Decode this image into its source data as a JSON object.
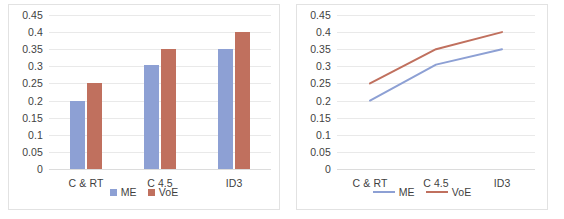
{
  "figure": {
    "panels": [
      {
        "id": "bar-panel",
        "name": "bar-chart-panel"
      },
      {
        "id": "line-panel",
        "name": "line-chart-panel"
      }
    ]
  },
  "colors": {
    "series_me": "#8DA0D4",
    "series_voe": "#C0705E",
    "gridline": "#E9E9E9",
    "axis_text": "#3F3F3F",
    "panel_border": "#E2E2E2",
    "background": "#FFFFFF"
  },
  "chart_data": [
    {
      "type": "bar",
      "title": "",
      "xlabel": "",
      "ylabel": "",
      "categories": [
        "C & RT",
        "C 4.5",
        "ID3"
      ],
      "series": [
        {
          "name": "ME",
          "values": [
            0.2,
            0.305,
            0.35
          ]
        },
        {
          "name": "VoE",
          "values": [
            0.25,
            0.35,
            0.4
          ]
        }
      ],
      "yticks": [
        0,
        0.05,
        0.1,
        0.15,
        0.2,
        0.25,
        0.3,
        0.35,
        0.4,
        0.45
      ],
      "ytick_labels": [
        "0",
        "0.05",
        "0.1",
        "0.15",
        "0.2",
        "0.25",
        "0.3",
        "0.35",
        "0.4",
        "0.45"
      ],
      "ylim": [
        0,
        0.45
      ],
      "grid": true,
      "legend": [
        "ME",
        "VoE"
      ],
      "legend_position": "bottom",
      "legend_marker": "square"
    },
    {
      "type": "line",
      "title": "",
      "xlabel": "",
      "ylabel": "",
      "categories": [
        "C & RT",
        "C 4.5",
        "ID3"
      ],
      "series": [
        {
          "name": "ME",
          "values": [
            0.2,
            0.305,
            0.35
          ]
        },
        {
          "name": "VoE",
          "values": [
            0.25,
            0.35,
            0.4
          ]
        }
      ],
      "yticks": [
        0,
        0.05,
        0.1,
        0.15,
        0.2,
        0.25,
        0.3,
        0.35,
        0.4,
        0.45
      ],
      "ytick_labels": [
        "0",
        "0.05",
        "0.1",
        "0.15",
        "0.2",
        "0.25",
        "0.3",
        "0.35",
        "0.4",
        "0.45"
      ],
      "ylim": [
        0,
        0.45
      ],
      "grid": true,
      "legend": [
        "ME",
        "VoE"
      ],
      "legend_position": "bottom",
      "legend_marker": "line"
    }
  ]
}
